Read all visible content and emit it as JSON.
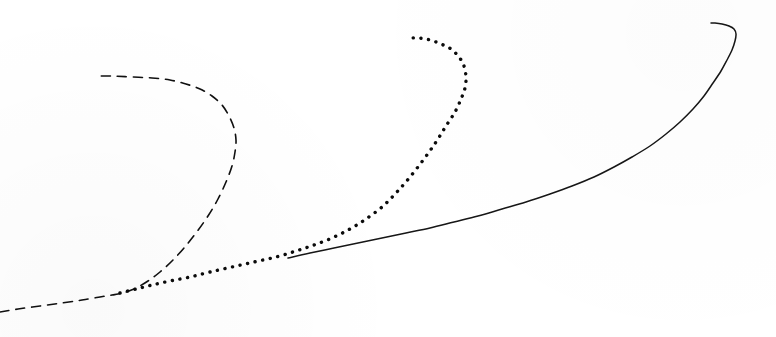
{
  "figure": {
    "title": "",
    "background_color": "#ffffff",
    "width": 776,
    "height": 337,
    "caption": ""
  },
  "chart_data": {
    "type": "line",
    "title": "",
    "subtitle": "",
    "xlabel": "",
    "ylabel": "",
    "xlim": [
      0,
      776
    ],
    "ylim": [
      337,
      0
    ],
    "grid": false,
    "axes_visible": false,
    "tick_labels_x": [],
    "tick_labels_y": [],
    "legend": {
      "visible": false,
      "position": "none",
      "entries": [
        "dashed curve",
        "dotted curve",
        "solid curve"
      ]
    },
    "annotations": [],
    "series": [
      {
        "name": "dashed curve",
        "style": "dashed",
        "color": "#101010",
        "line_width": 1.6,
        "dash_pattern": "9 7",
        "points": [
          [
            0,
            312
          ],
          [
            18,
            309
          ],
          [
            40,
            306
          ],
          [
            62,
            303
          ],
          [
            82,
            300
          ],
          [
            100,
            297
          ],
          [
            112,
            295
          ],
          [
            118,
            294
          ],
          [
            126,
            292
          ],
          [
            136,
            288
          ],
          [
            148,
            281
          ],
          [
            160,
            272
          ],
          [
            172,
            261
          ],
          [
            184,
            248
          ],
          [
            196,
            233
          ],
          [
            208,
            216
          ],
          [
            218,
            199
          ],
          [
            226,
            182
          ],
          [
            232,
            166
          ],
          [
            235,
            152
          ],
          [
            236,
            140
          ],
          [
            234,
            128
          ],
          [
            229,
            116
          ],
          [
            222,
            105
          ],
          [
            212,
            96
          ],
          [
            200,
            89
          ],
          [
            186,
            84
          ],
          [
            170,
            80
          ],
          [
            152,
            78
          ],
          [
            132,
            77
          ],
          [
            112,
            76
          ],
          [
            95,
            76
          ]
        ]
      },
      {
        "name": "dotted curve",
        "style": "dotted",
        "color": "#0b0b0b",
        "line_width": 3.4,
        "dash_pattern": "0.1 7.6",
        "points": [
          [
            120,
            293
          ],
          [
            136,
            289
          ],
          [
            152,
            285
          ],
          [
            170,
            281
          ],
          [
            190,
            277
          ],
          [
            210,
            272
          ],
          [
            232,
            267
          ],
          [
            254,
            262
          ],
          [
            276,
            257
          ],
          [
            296,
            251
          ],
          [
            314,
            245
          ],
          [
            332,
            238
          ],
          [
            350,
            229
          ],
          [
            366,
            219
          ],
          [
            382,
            207
          ],
          [
            396,
            193
          ],
          [
            410,
            177
          ],
          [
            424,
            159
          ],
          [
            436,
            142
          ],
          [
            446,
            126
          ],
          [
            455,
            112
          ],
          [
            461,
            99
          ],
          [
            465,
            88
          ],
          [
            466,
            77
          ],
          [
            464,
            66
          ],
          [
            459,
            57
          ],
          [
            451,
            49
          ],
          [
            441,
            44
          ],
          [
            430,
            40
          ],
          [
            419,
            38
          ],
          [
            408,
            38
          ]
        ]
      },
      {
        "name": "solid curve",
        "style": "solid",
        "color": "#161616",
        "line_width": 1.5,
        "dash_pattern": "none",
        "points": [
          [
            288,
            258
          ],
          [
            310,
            253
          ],
          [
            334,
            248
          ],
          [
            358,
            243
          ],
          [
            382,
            238
          ],
          [
            406,
            233
          ],
          [
            430,
            228
          ],
          [
            454,
            222
          ],
          [
            478,
            216
          ],
          [
            502,
            209
          ],
          [
            526,
            202
          ],
          [
            550,
            194
          ],
          [
            572,
            186
          ],
          [
            594,
            177
          ],
          [
            614,
            167
          ],
          [
            632,
            157
          ],
          [
            650,
            146
          ],
          [
            666,
            134
          ],
          [
            680,
            122
          ],
          [
            693,
            109
          ],
          [
            704,
            96
          ],
          [
            713,
            83
          ],
          [
            721,
            71
          ],
          [
            727,
            60
          ],
          [
            732,
            50
          ],
          [
            735,
            41
          ],
          [
            736,
            34
          ],
          [
            734,
            29
          ],
          [
            729,
            26
          ],
          [
            722,
            24
          ],
          [
            715,
            23
          ],
          [
            711,
            23
          ]
        ]
      }
    ]
  }
}
